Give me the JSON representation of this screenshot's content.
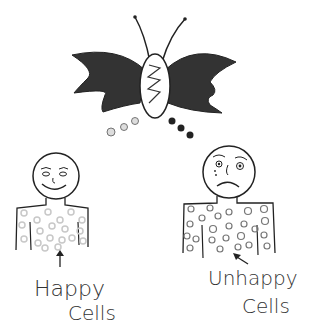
{
  "illustration": {
    "center": {
      "subject": "butterfly",
      "wing_color": "#333333",
      "body_color": "#ffffff"
    },
    "left_figure": {
      "expression": "smiling",
      "cell_color": "#d0d0d0",
      "label_line1": "Happy",
      "label_line2": "Cells"
    },
    "right_figure": {
      "expression": "frowning",
      "cell_color": "#888888",
      "label_line1": "Unhappy",
      "label_line2": "Cells"
    },
    "colors": {
      "ink": "#222222",
      "background": "#ffffff"
    }
  }
}
